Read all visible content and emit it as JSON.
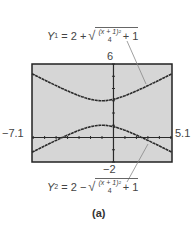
{
  "chart_data": {
    "type": "line",
    "title": "",
    "caption": "(a)",
    "xlabel": "",
    "ylabel": "",
    "xlim": [
      -7.1,
      5.1
    ],
    "ylim": [
      -2,
      6
    ],
    "grid": false,
    "axis_labels": {
      "xmin": "−7.1",
      "xmax": "5.1",
      "ymax": "6",
      "ymin": "−2"
    },
    "series": [
      {
        "name": "Y1",
        "equation": "Y1 = 2 + sqrt((x + 1)^2 / 4 + 1)",
        "x": [
          -7.1,
          -6,
          -5,
          -4,
          -3,
          -2,
          -1,
          0,
          1,
          2,
          3,
          4,
          5.1
        ],
        "values": [
          5.27,
          4.69,
          4.24,
          3.8,
          3.41,
          3.12,
          3.0,
          3.12,
          3.41,
          3.8,
          4.24,
          4.69,
          5.27
        ]
      },
      {
        "name": "Y2",
        "equation": "Y2 = 2 − sqrt((x + 1)^2 / 4 + 1)",
        "x": [
          -7.1,
          -6,
          -5,
          -4,
          -3,
          -2,
          -1,
          0,
          1,
          2,
          3,
          4,
          5.1
        ],
        "values": [
          -1.27,
          -0.69,
          -0.24,
          0.2,
          0.59,
          0.88,
          1.0,
          0.88,
          0.59,
          0.2,
          -0.24,
          -0.69,
          -1.27
        ]
      }
    ],
    "annotations": [
      {
        "target": "Y1",
        "text": "Y1 = 2 + √((x + 1)²/4 + 1)",
        "position": "top"
      },
      {
        "target": "Y2",
        "text": "Y2 = 2 − √((x + 1)²/4 + 1)",
        "position": "bottom"
      }
    ]
  },
  "labels": {
    "ymax": "6",
    "ymin": "−2",
    "xmin": "−7.1",
    "xmax": "5.1",
    "caption": "(a)"
  },
  "eq1": {
    "lhs": "Y",
    "sub": "1",
    "op": "= 2 +",
    "num": "(x + 1)²",
    "den": "4",
    "tail": "+ 1"
  },
  "eq2": {
    "lhs": "Y",
    "sub": "2",
    "op": "= 2 −",
    "num": "(x + 1)²",
    "den": "4",
    "tail": "+ 1"
  },
  "colors": {
    "screen_bg": "#d6d6d6",
    "frame": "#222222",
    "curve": "#2a2a2a",
    "leader": "#888888"
  }
}
